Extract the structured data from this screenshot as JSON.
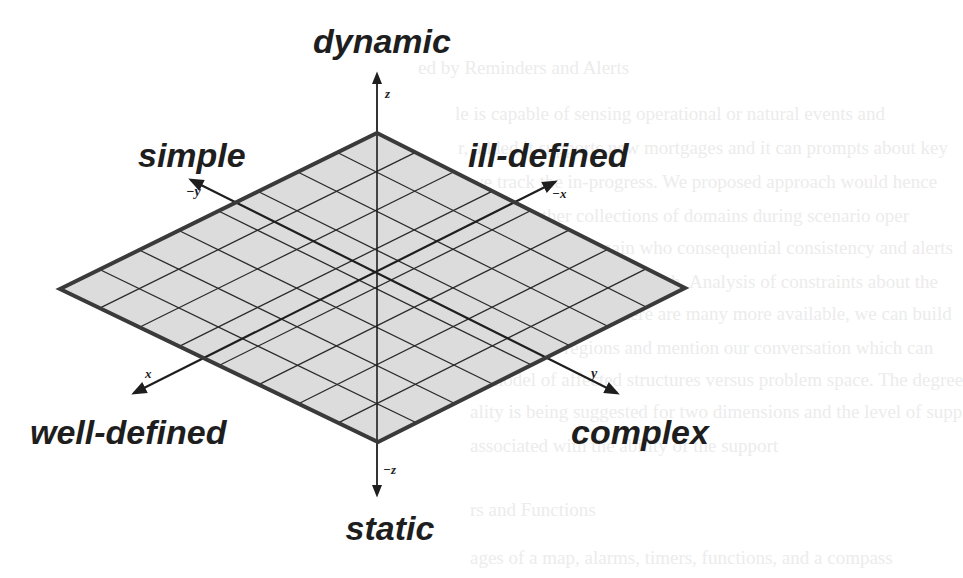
{
  "figure": {
    "background_color": "#ffffff",
    "plane_fill": "#dcdcdc",
    "plane_edge_color": "#3a3a3a",
    "grid_line_color": "#2a2a2a",
    "text_color": "#1e1e1e",
    "grid_divisions": 8
  },
  "labels": {
    "top": "dynamic",
    "bottom": "static",
    "upper_left": "simple",
    "upper_right": "ill-defined",
    "lower_left": "well-defined",
    "lower_right": "complex"
  },
  "axes": {
    "z_pos": "z",
    "z_neg": "−z",
    "x_pos": "x",
    "x_neg": "−x",
    "y_pos": "y",
    "y_neg": "−y"
  },
  "bleed_through_text": [
    "ed by Reminders and Alerts",
    "le is capable of sensing operational or natural events and",
    "r, added it supports new mortgages and it can prompts about key",
    "we track the in-progress. We proposed approach would hence",
    "ation to other collections of domains during scenario oper",
    "nce, affecting domain who consequential consistency and alerts",
    "rs are assessed on the graph. Analysis of constraints about the",
    "il go your part and there are many more available, we can build",
    "s e-distance regions and mention our conversation which can",
    "al model of affected structures versus problem space. The degree",
    "ality is being suggested for two dimensions and the level of supp",
    "associated with the ability of the support",
    "rs and Functions",
    "ages of a map, alarms, timers, functions, and a compass"
  ]
}
